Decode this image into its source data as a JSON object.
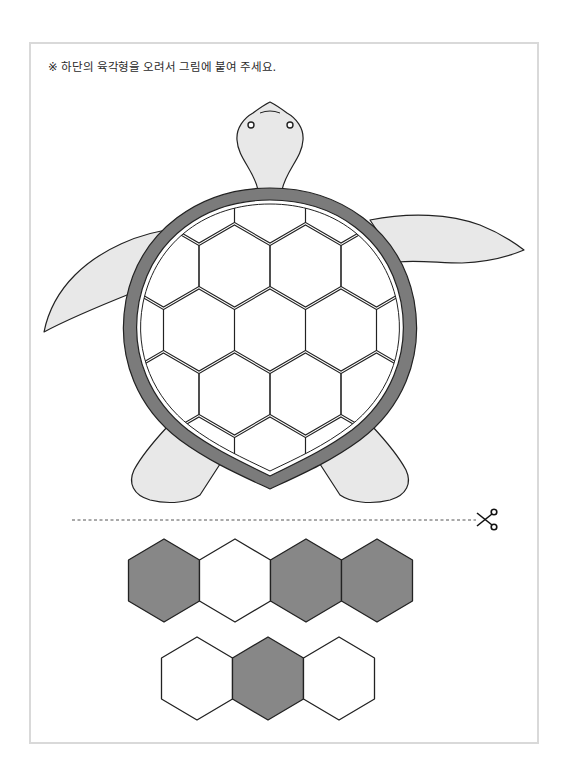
{
  "instruction": {
    "marker": "※",
    "text": "하단의 육각형을 오려서 그림에 붙여 주세요."
  },
  "colors": {
    "frame_border": "#d9d9d9",
    "shell_rim": "#7b7b7b",
    "skin_fill": "#e8e8e8",
    "hex_dark": "#878787",
    "hex_light": "#ffffff",
    "outline": "#222222"
  },
  "turtle": {
    "parts": [
      "head",
      "shell",
      "front-left-flipper",
      "front-right-flipper",
      "rear-left-flipper",
      "rear-right-flipper"
    ],
    "shell_hex_slots": 7
  },
  "cut_line": {
    "style": "dashed",
    "icon": "scissors-icon"
  },
  "cutout_hexagons": {
    "row1": [
      "dark",
      "light",
      "dark",
      "dark"
    ],
    "row2": [
      "light",
      "dark",
      "light"
    ]
  }
}
